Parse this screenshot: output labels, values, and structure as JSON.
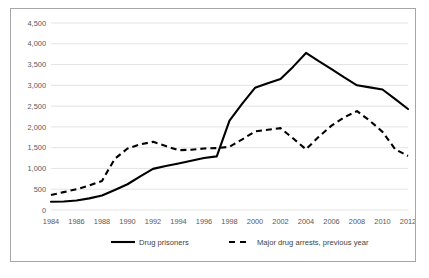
{
  "chart_data": {
    "type": "line",
    "title": "",
    "xlabel": "",
    "ylabel": "",
    "xlim": [
      1984,
      2012
    ],
    "ylim": [
      0,
      4500
    ],
    "grid": true,
    "legend_position": "bottom",
    "y_ticks": [
      "0",
      "500",
      "1,000",
      "1,500",
      "2,000",
      "2,500",
      "3,000",
      "3,500",
      "4,000",
      "4,500"
    ],
    "y_tick_values": [
      0,
      500,
      1000,
      1500,
      2000,
      2500,
      3000,
      3500,
      4000,
      4500
    ],
    "x_ticks": [
      "1984",
      "1986",
      "1988",
      "1990",
      "1992",
      "1994",
      "1996",
      "1998",
      "2000",
      "2002",
      "2004",
      "2006",
      "2008",
      "2010",
      "2012"
    ],
    "x_tick_values": [
      1984,
      1986,
      1988,
      1990,
      1992,
      1994,
      1996,
      1998,
      2000,
      2002,
      2004,
      2006,
      2008,
      2010,
      2012
    ],
    "series": [
      {
        "name": "Drug prisoners",
        "style": "solid",
        "color": "#000000",
        "x": [
          1984,
          1985,
          1986,
          1987,
          1988,
          1989,
          1990,
          1991,
          1992,
          1993,
          1994,
          1995,
          1996,
          1997,
          1998,
          1999,
          2000,
          2001,
          2002,
          2003,
          2004,
          2005,
          2006,
          2007,
          2008,
          2009,
          2010,
          2011,
          2012
        ],
        "values": [
          200,
          205,
          230,
          280,
          350,
          480,
          620,
          810,
          990,
          1060,
          1120,
          1185,
          1250,
          1290,
          2150,
          2560,
          2940,
          3050,
          3150,
          3450,
          3780,
          3580,
          3390,
          3190,
          3000,
          2950,
          2900,
          2670,
          2430
        ]
      },
      {
        "name": "Major drug arrests, previous year",
        "style": "dashed",
        "color": "#000000",
        "x": [
          1984,
          1985,
          1986,
          1987,
          1988,
          1989,
          1990,
          1991,
          1992,
          1993,
          1994,
          1995,
          1996,
          1997,
          1998,
          1999,
          2000,
          2001,
          2002,
          2003,
          2004,
          2005,
          2006,
          2007,
          2008,
          2009,
          2010,
          2011,
          2012
        ],
        "values": [
          360,
          430,
          500,
          590,
          700,
          1230,
          1480,
          1580,
          1640,
          1540,
          1440,
          1450,
          1480,
          1490,
          1520,
          1700,
          1890,
          1930,
          1970,
          1720,
          1460,
          1760,
          2030,
          2230,
          2380,
          2150,
          1880,
          1460,
          1300
        ]
      }
    ]
  },
  "legend": {
    "items": [
      {
        "label": "Drug prisoners",
        "style": "solid"
      },
      {
        "label": "Major drug arrests, previous year",
        "style": "dashed"
      }
    ]
  }
}
